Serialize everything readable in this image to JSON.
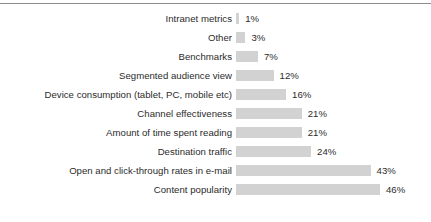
{
  "chart_data": {
    "type": "bar",
    "orientation": "horizontal",
    "title": "",
    "subtitle": "",
    "xlabel": "",
    "ylabel": "",
    "grid": false,
    "legend": null,
    "xlim": [
      0,
      46
    ],
    "value_suffix": "%",
    "bar_color": "#d2d2d2",
    "text_color": "#2b2b2b",
    "rule_color": "#8c8c8c",
    "categories": [
      "Intranet metrics",
      "Other",
      "Benchmarks",
      "Segmented audience view",
      "Device consumption (tablet, PC, mobile etc)",
      "Channel effectiveness",
      "Amount of time spent reading",
      "Destination traffic",
      "Open and click-through rates in e-mail",
      "Content popularity"
    ],
    "values": [
      1,
      3,
      7,
      12,
      16,
      21,
      21,
      24,
      43,
      46
    ],
    "value_labels": [
      "1%",
      "3%",
      "7%",
      "12%",
      "16%",
      "21%",
      "21%",
      "24%",
      "43%",
      "46%"
    ],
    "rows": [
      {
        "label": "Intranet metrics",
        "value": 1,
        "value_label": "1%"
      },
      {
        "label": "Other",
        "value": 3,
        "value_label": "3%"
      },
      {
        "label": "Benchmarks",
        "value": 7,
        "value_label": "7%"
      },
      {
        "label": "Segmented audience view",
        "value": 12,
        "value_label": "12%"
      },
      {
        "label": "Device consumption (tablet, PC, mobile etc)",
        "value": 16,
        "value_label": "16%"
      },
      {
        "label": "Channel effectiveness",
        "value": 21,
        "value_label": "21%"
      },
      {
        "label": "Amount of time spent reading",
        "value": 21,
        "value_label": "21%"
      },
      {
        "label": "Destination traffic",
        "value": 24,
        "value_label": "24%"
      },
      {
        "label": "Open and click-through rates in e-mail",
        "value": 43,
        "value_label": "43%"
      },
      {
        "label": "Content popularity",
        "value": 46,
        "value_label": "46%"
      }
    ]
  },
  "layout": {
    "px_per_percent": 3.13
  }
}
